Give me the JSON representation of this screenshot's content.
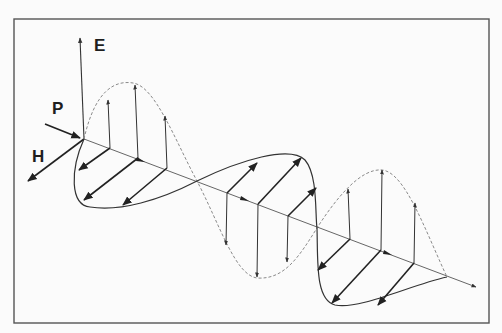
{
  "diagram": {
    "type": "electromagnetic-wave",
    "labels": {
      "electric_field": "E",
      "poynting_vector": "P",
      "magnetic_field": "H"
    },
    "colors": {
      "background": "#fbfbfb",
      "frame": "#555555",
      "ink": "#222222",
      "dashed_wave": "#8a8a8a"
    },
    "components": [
      {
        "name": "E-wave",
        "style": "dashed",
        "orientation": "vertical"
      },
      {
        "name": "H-wave",
        "style": "solid",
        "orientation": "horizontal"
      },
      {
        "name": "propagation-axis",
        "style": "solid-thin",
        "direction": "right-down"
      }
    ]
  }
}
